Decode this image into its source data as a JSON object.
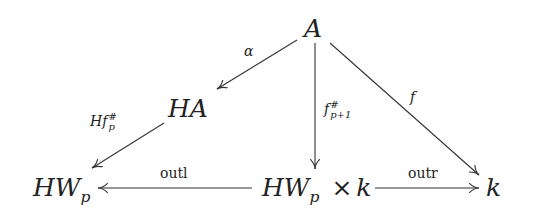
{
  "diagram": {
    "type": "commutative-diagram",
    "nodes": {
      "A": {
        "label": "A",
        "x": 313,
        "y": 30
      },
      "HA": {
        "label": "HA",
        "x": 190,
        "y": 108
      },
      "HWp": {
        "label": "HW",
        "sub": "p",
        "x": 62,
        "y": 188
      },
      "HWpk": {
        "label": "HW",
        "sub": "p",
        "times": "×",
        "tail": "k",
        "x": 313,
        "y": 188
      },
      "k": {
        "label": "k",
        "x": 492,
        "y": 188
      }
    },
    "edges": [
      {
        "from": "A",
        "to": "HA",
        "label": "α"
      },
      {
        "from": "HA",
        "to": "HWp",
        "label": "Hf",
        "label_sup": "#",
        "label_sub": "p"
      },
      {
        "from": "A",
        "to": "HWpk",
        "label": "f",
        "label_sup": "#",
        "label_sub": "p+1"
      },
      {
        "from": "A",
        "to": "k",
        "label": "f"
      },
      {
        "from": "HWpk",
        "to": "HWp",
        "label": "outl"
      },
      {
        "from": "HWpk",
        "to": "k",
        "label": "outr"
      }
    ],
    "colors": {
      "ink": "#222222",
      "background": "#ffffff"
    }
  }
}
